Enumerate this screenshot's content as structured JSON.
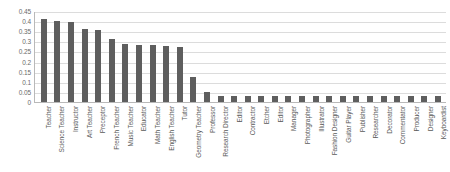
{
  "chart_data": {
    "type": "bar",
    "title": "",
    "subtitle": "",
    "xlabel": "",
    "ylabel": "",
    "ylim": [
      0,
      0.45
    ],
    "grid": true,
    "legend": false,
    "legend_position": "none",
    "bar_color": "#5e5e5e",
    "gridline_color": "#dcdcdc",
    "axis_color": "#b9b9b9",
    "y_ticks": [
      "0",
      "0.05",
      "0.1",
      "0.15",
      "0.2",
      "0.25",
      "0.3",
      "0.35",
      "0.4",
      "0.45"
    ],
    "y_tick_values": [
      0,
      0.05,
      0.1,
      0.15,
      0.2,
      0.25,
      0.3,
      0.35,
      0.4,
      0.45
    ],
    "categories": [
      "Teacher",
      "Science Teacher",
      "Instructor",
      "Art Teacher",
      "Preceptor",
      "French Teacher",
      "Music Teacher",
      "Educator",
      "Math Teacher",
      "English Teacher",
      "Tutor",
      "Geometry Teacher",
      "Professor",
      "Research Director",
      "Editor",
      "Contractor",
      "Etcher",
      "Editor",
      "Manager",
      "Photographer",
      "Illustrator",
      "Fashion Designer",
      "Guitar Player",
      "Publisher",
      "Researcher",
      "Decorator",
      "Commentator",
      "Producer",
      "Designer",
      "Keyboardist"
    ],
    "values": [
      0.41,
      0.4,
      0.395,
      0.36,
      0.355,
      0.31,
      0.285,
      0.28,
      0.28,
      0.275,
      0.27,
      0.125,
      0.05,
      0.03,
      0.03,
      0.03,
      0.03,
      0.03,
      0.03,
      0.03,
      0.03,
      0.03,
      0.03,
      0.03,
      0.03,
      0.03,
      0.03,
      0.03,
      0.03,
      0.03
    ]
  }
}
